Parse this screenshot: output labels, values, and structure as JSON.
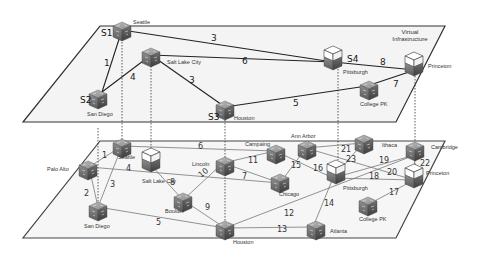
{
  "diagram": {
    "title_line1": "Virtual",
    "title_line2": "Infrastructure",
    "virtual_layer": {
      "nodes": [
        {
          "id": "S1",
          "city": "Seattle",
          "type": "router"
        },
        {
          "id": "S2",
          "city": "San Diego",
          "type": "router"
        },
        {
          "id": "",
          "city": "Salt Lake City",
          "type": "router"
        },
        {
          "id": "S3",
          "city": "Houston",
          "type": "router"
        },
        {
          "id": "S4",
          "city": "Pittsburgh",
          "type": "server"
        },
        {
          "id": "",
          "city": "Princeton",
          "type": "server"
        },
        {
          "id": "",
          "city": "College PK",
          "type": "router"
        }
      ],
      "links": [
        {
          "from": "Seattle",
          "to": "San Diego",
          "weight": "1"
        },
        {
          "from": "Seattle",
          "to": "Pittsburgh",
          "weight": "3"
        },
        {
          "from": "San Diego",
          "to": "Salt Lake City",
          "weight": "4"
        },
        {
          "from": "Salt Lake City",
          "to": "Pittsburgh",
          "weight": "6"
        },
        {
          "from": "Salt Lake City",
          "to": "Houston",
          "weight": "3"
        },
        {
          "from": "Houston",
          "to": "College PK",
          "weight": "5"
        },
        {
          "from": "Pittsburgh",
          "to": "Princeton",
          "weight": "8"
        },
        {
          "from": "College PK",
          "to": "Princeton",
          "weight": "7"
        }
      ]
    },
    "physical_layer": {
      "nodes": [
        {
          "city": "Palo Alto"
        },
        {
          "city": "Seattle"
        },
        {
          "city": "San Diego"
        },
        {
          "city": "Salt Lake City"
        },
        {
          "city": "Boulder"
        },
        {
          "city": "Lincoln"
        },
        {
          "city": "Houston"
        },
        {
          "city": "Campaing"
        },
        {
          "city": "Ann Arbor"
        },
        {
          "city": "Chicago"
        },
        {
          "city": "Pittsburgh"
        },
        {
          "city": "Ithaca"
        },
        {
          "city": "Cambridge"
        },
        {
          "city": "Princeton"
        },
        {
          "city": "College PK"
        },
        {
          "city": "Atlanta"
        }
      ],
      "links": [
        {
          "from": "Palo Alto",
          "to": "Seattle",
          "weight": "1"
        },
        {
          "from": "Palo Alto",
          "to": "San Diego",
          "weight": "2"
        },
        {
          "from": "Seattle",
          "to": "San Diego",
          "weight": "3"
        },
        {
          "from": "Palo Alto",
          "to": "Chicago",
          "weight": "4"
        },
        {
          "from": "San Diego",
          "to": "Houston",
          "weight": "5"
        },
        {
          "from": "Seattle",
          "to": "Campaing",
          "weight": "6"
        },
        {
          "from": "Lincoln",
          "to": "Chicago",
          "weight": "7"
        },
        {
          "from": "Salt Lake City",
          "to": "Boulder",
          "weight": "8"
        },
        {
          "from": "Boulder",
          "to": "Houston",
          "weight": "9"
        },
        {
          "from": "Boulder",
          "to": "Lincoln",
          "weight": "10"
        },
        {
          "from": "Lincoln",
          "to": "Campaing",
          "weight": "11"
        },
        {
          "from": "Houston",
          "to": "Cambridge",
          "weight": "12"
        },
        {
          "from": "Houston",
          "to": "Atlanta",
          "weight": "13"
        },
        {
          "from": "Atlanta",
          "to": "Pittsburgh",
          "weight": "14"
        },
        {
          "from": "Chicago",
          "to": "Ann Arbor",
          "weight": "15"
        },
        {
          "from": "Campaing",
          "to": "Pittsburgh",
          "weight": "16"
        },
        {
          "from": "College PK",
          "to": "Princeton",
          "weight": "17"
        },
        {
          "from": "Pittsburgh",
          "to": "Princeton",
          "weight": "18"
        },
        {
          "from": "Pittsburgh",
          "to": "Cambridge",
          "weight": "19"
        },
        {
          "from": "Ann Arbor",
          "to": "Princeton",
          "weight": "20"
        },
        {
          "from": "Ann Arbor",
          "to": "Ithaca",
          "weight": "21"
        },
        {
          "from": "Cambridge",
          "to": "Princeton",
          "weight": "22"
        },
        {
          "from": "Pittsburgh",
          "to": "Ithaca",
          "weight": "23"
        }
      ]
    }
  }
}
